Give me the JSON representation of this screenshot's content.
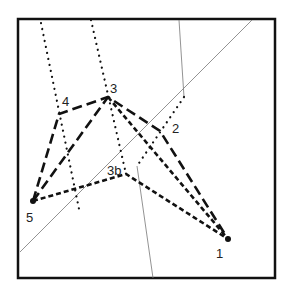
{
  "diagram": {
    "frame": {
      "x": 18,
      "y": 19,
      "width": 257,
      "height": 259,
      "stroke": "#111111"
    },
    "points": [
      {
        "id": "1",
        "label": "1",
        "x": 228,
        "y": 239,
        "lx": 216,
        "ly": 258
      },
      {
        "id": "2",
        "label": "2",
        "x": 160,
        "y": 131,
        "lx": 172,
        "ly": 133
      },
      {
        "id": "3",
        "label": "3",
        "x": 108,
        "y": 97,
        "lx": 110,
        "ly": 93
      },
      {
        "id": "3b",
        "label": "3b",
        "x": 126,
        "y": 174,
        "lx": 107,
        "ly": 175
      },
      {
        "id": "4",
        "label": "4",
        "x": 59,
        "y": 114,
        "lx": 62,
        "ly": 106
      },
      {
        "id": "5",
        "label": "5",
        "x": 33,
        "y": 201,
        "lx": 26,
        "ly": 222
      }
    ],
    "long_dash_path": "5-4-3-2-1 and 5-3",
    "short_dash_path": "5-3b-1 and 3-1",
    "thin_lines": [
      {
        "x1": 20,
        "y1": 252,
        "x2": 252,
        "y2": 20
      },
      {
        "x1": 179,
        "y1": 20,
        "x2": 184,
        "y2": 97
      },
      {
        "x1": 137,
        "y1": 166,
        "x2": 153,
        "y2": 278
      }
    ],
    "dotted_lines": [
      {
        "x1": 41,
        "y1": 23,
        "x2": 79,
        "y2": 209
      },
      {
        "x1": 91,
        "y1": 20,
        "x2": 126,
        "y2": 174
      },
      {
        "x1": 184,
        "y1": 97,
        "x2": 137,
        "y2": 166
      }
    ]
  }
}
